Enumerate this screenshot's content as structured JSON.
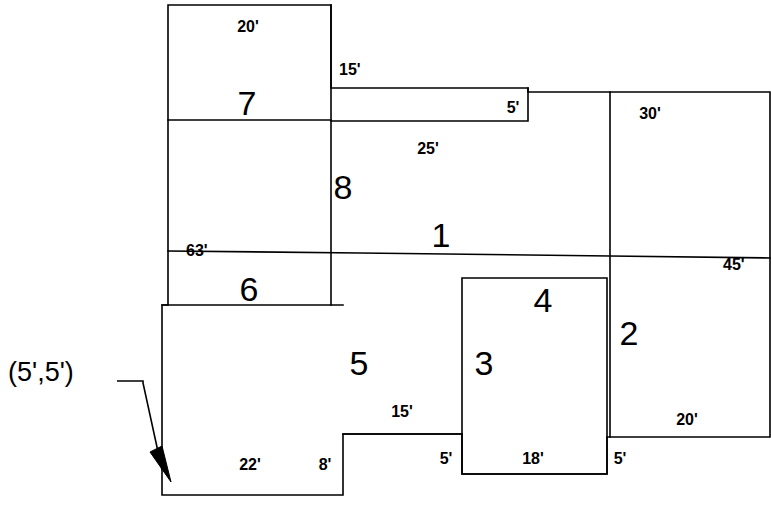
{
  "diagram": {
    "stroke_color": "#000000",
    "background_color": "#ffffff",
    "origin_marker": {
      "label": "(5',5')",
      "x": 8,
      "y": 381
    },
    "zones": [
      {
        "id": "zone-7",
        "label": "7",
        "x": 247,
        "y": 115
      },
      {
        "id": "zone-8",
        "label": "8",
        "x": 343,
        "y": 199
      },
      {
        "id": "zone-1",
        "label": "1",
        "x": 441,
        "y": 247
      },
      {
        "id": "zone-6",
        "label": "6",
        "x": 249,
        "y": 301
      },
      {
        "id": "zone-5",
        "label": "5",
        "x": 359,
        "y": 375
      },
      {
        "id": "zone-4",
        "label": "4",
        "x": 543,
        "y": 312
      },
      {
        "id": "zone-3",
        "label": "3",
        "x": 484,
        "y": 375
      },
      {
        "id": "zone-2",
        "label": "2",
        "x": 629,
        "y": 345
      }
    ],
    "dimensions": [
      {
        "id": "dim-20-top",
        "label": "20'",
        "x": 248,
        "y": 32,
        "anchor": "middle"
      },
      {
        "id": "dim-15-right-of-7",
        "label": "15'",
        "x": 339,
        "y": 75,
        "anchor": "start"
      },
      {
        "id": "dim-5-top-step",
        "label": "5'",
        "x": 513,
        "y": 113,
        "anchor": "middle"
      },
      {
        "id": "dim-30-top-right",
        "label": "30'",
        "x": 650,
        "y": 119,
        "anchor": "middle"
      },
      {
        "id": "dim-25-below-1",
        "label": "25'",
        "x": 428,
        "y": 154,
        "anchor": "middle"
      },
      {
        "id": "dim-63-left",
        "label": "63'",
        "x": 186,
        "y": 256,
        "anchor": "start"
      },
      {
        "id": "dim-45-right",
        "label": "45'",
        "x": 723,
        "y": 270,
        "anchor": "start"
      },
      {
        "id": "dim-15-bottom-mid",
        "label": "15'",
        "x": 402,
        "y": 417,
        "anchor": "middle"
      },
      {
        "id": "dim-20-bottom-right",
        "label": "20'",
        "x": 687,
        "y": 425,
        "anchor": "middle"
      },
      {
        "id": "dim-5-bottom-mid",
        "label": "5'",
        "x": 446,
        "y": 464,
        "anchor": "middle"
      },
      {
        "id": "dim-18-bottom",
        "label": "18'",
        "x": 533,
        "y": 464,
        "anchor": "middle"
      },
      {
        "id": "dim-5-bottom-right",
        "label": "5'",
        "x": 620,
        "y": 464,
        "anchor": "middle"
      },
      {
        "id": "dim-22-bottom-left",
        "label": "22'",
        "x": 250,
        "y": 470,
        "anchor": "middle"
      },
      {
        "id": "dim-8-bottom-left",
        "label": "8'",
        "x": 325,
        "y": 470,
        "anchor": "middle"
      }
    ],
    "paths": {
      "outline": "M 169 5 L 331 5 L 331 88 L 528 88 L 528 92 L 770 92 L 770 437 L 607 437 L 607 474 L 462 474 L 462 434 L 343 434 L 343 495 L 162 495 L 162 305 L 168 305 L 168 5 Z",
      "wall_7_bottom": "M 168 120 L 331 120",
      "wall_step_top": "M 331 121 L 528 121 L 528 88",
      "wall_1_bottom": "M 168 251 L 360 253 L 610 256 L 770 258",
      "wall_6_bottom": "M 162 305 L 343 305",
      "wall_v_8": "M 331 5 L 331 305",
      "wall_v_right_top": "M 610 92 L 610 437",
      "wall_room34_box": "M 462 278 L 607 278 L 607 474 L 462 474 Z",
      "wall_5_bottom": "M 343 434 L 462 434",
      "leader_line": "M 117 381 L 143 381 L 143 383 L 162 470",
      "arrow_points": "150 452 171 482 162 446"
    }
  }
}
